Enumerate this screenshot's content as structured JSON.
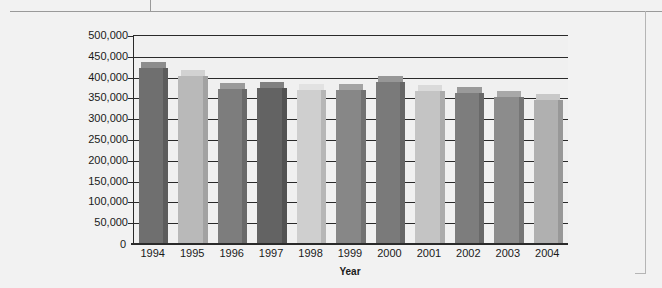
{
  "chart_data": {
    "type": "bar",
    "title": "",
    "xlabel": "Year",
    "ylabel": "",
    "ylim": [
      0,
      500000
    ],
    "ytick_step": 50000,
    "grid": true,
    "legend": false,
    "categories": [
      "1994",
      "1995",
      "1996",
      "1997",
      "1998",
      "1999",
      "2000",
      "2001",
      "2002",
      "2003",
      "2004"
    ],
    "values": [
      424000,
      404000,
      373000,
      374000,
      370000,
      370000,
      390000,
      368000,
      362000,
      353000,
      345000
    ],
    "ytick_labels": [
      "500,000",
      "450,000",
      "400,000",
      "350,000",
      "300,000",
      "250,000",
      "200,000",
      "150,000",
      "100,000",
      "50,000",
      "0"
    ],
    "ytick_values": [
      500000,
      450000,
      400000,
      350000,
      300000,
      250000,
      200000,
      150000,
      100000,
      50000,
      0
    ],
    "bar_colors": [
      "#6f6f6f",
      "#b9b9b9",
      "#7d7d7d",
      "#636363",
      "#cfcfcf",
      "#878787",
      "#7a7a7a",
      "#c4c4c4",
      "#7d7d7d",
      "#8c8c8c",
      "#b0b0b0"
    ],
    "bar_top_colors": [
      "#8c8c8c",
      "#d2d2d2",
      "#9a9a9a",
      "#808080",
      "#e2e2e2",
      "#a3a3a3",
      "#979797",
      "#dadada",
      "#9a9a9a",
      "#a8a8a8",
      "#c8c8c8"
    ],
    "bar_side_colors": [
      "#5c5c5c",
      "#a2a2a2",
      "#696969",
      "#525252",
      "#b6b6b6",
      "#727272",
      "#676767",
      "#ababab",
      "#696969",
      "#767676",
      "#989898"
    ]
  },
  "axes": {
    "x_axis_title": "Year",
    "zero_label": "0"
  }
}
